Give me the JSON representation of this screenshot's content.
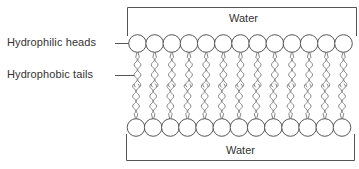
{
  "labels": {
    "heads": "Hydrophilic heads",
    "tails": "Hydrophobic tails",
    "water_top": "Water",
    "water_bottom": "Water"
  },
  "diagram": {
    "type": "phospholipid-bilayer",
    "lipids_per_layer": 13,
    "layers": [
      "top",
      "bottom"
    ],
    "stroke_color": "#555555",
    "tail_color": "#777777"
  }
}
